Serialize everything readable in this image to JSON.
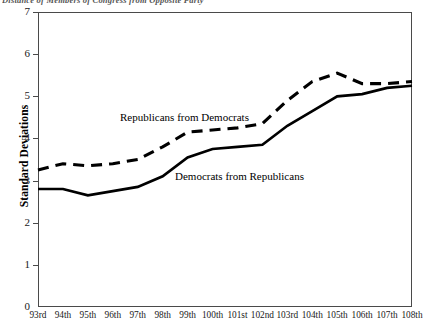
{
  "figure": {
    "caption": "Distance of Members of Congress from Opposite Party"
  },
  "axes": {
    "ylabel": "Standard Deviations",
    "yticks": [
      0,
      1,
      2,
      3,
      4,
      5,
      6,
      7
    ],
    "ylim": [
      0,
      7
    ],
    "xlabel": "",
    "xticks": [
      "93rd",
      "94th",
      "95th",
      "96th",
      "97th",
      "98th",
      "99th",
      "100th",
      "101st",
      "102nd",
      "103rd",
      "104th",
      "105th",
      "106th",
      "107th",
      "108th"
    ]
  },
  "series_labels": {
    "republicans": "Republicans from Democrats",
    "democrats": "Democrats from Republicans"
  },
  "colors": {
    "line": "#000000",
    "frame": "#4a4a4a",
    "background": "#ffffff"
  },
  "chart_data": {
    "type": "line",
    "title": "",
    "xlabel": "",
    "ylabel": "Standard Deviations",
    "ylim": [
      0,
      7
    ],
    "grid": false,
    "legend": "inline-annotations",
    "categories": [
      "93rd",
      "94th",
      "95th",
      "96th",
      "97th",
      "98th",
      "99th",
      "100th",
      "101st",
      "102nd",
      "103rd",
      "104th",
      "105th",
      "106th",
      "107th",
      "108th"
    ],
    "series": [
      {
        "name": "Republicans from Democrats",
        "style": "dashed",
        "values": [
          3.25,
          3.4,
          3.35,
          3.4,
          3.5,
          3.8,
          4.15,
          4.2,
          4.25,
          4.35,
          4.9,
          5.35,
          5.55,
          5.3,
          5.3,
          5.35
        ]
      },
      {
        "name": "Democrats from Republicans",
        "style": "solid",
        "values": [
          2.8,
          2.8,
          2.65,
          2.75,
          2.85,
          3.1,
          3.55,
          3.75,
          3.8,
          3.85,
          4.3,
          4.65,
          5.0,
          5.05,
          5.2,
          5.25
        ]
      }
    ]
  }
}
